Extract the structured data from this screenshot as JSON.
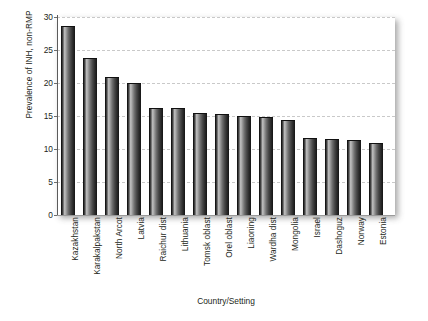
{
  "chart_data": {
    "type": "bar",
    "title": "",
    "xlabel": "Country/Setting",
    "ylabel": "Prevalence of INH, non-RMP",
    "ylim": [
      0,
      30
    ],
    "yticks": [
      0,
      5,
      10,
      15,
      20,
      25,
      30
    ],
    "ytick_labels": [
      "0",
      "5",
      "10",
      "15",
      "20",
      "25",
      "30"
    ],
    "grid": true,
    "legend": false,
    "categories": [
      "Kazakhstan",
      "Karakalpakstan",
      "North Arcot",
      "Latvia",
      "Raichur dist",
      "Lithuania",
      "Tomsk oblast",
      "Orel oblast",
      "Liaoning",
      "Wardha dist",
      "Mongolia",
      "Israel",
      "Dashoguz",
      "Norway",
      "Estonia"
    ],
    "values": [
      28.5,
      23.7,
      20.7,
      19.8,
      16.1,
      16.0,
      15.3,
      15.2,
      14.8,
      14.7,
      14.3,
      11.5,
      11.4,
      11.2,
      10.7
    ],
    "bar_color": "#3a3a3a",
    "gridline_color": "#c9c9c9",
    "axis_color": "#5b5b5b",
    "background_color": "#ffffff"
  }
}
